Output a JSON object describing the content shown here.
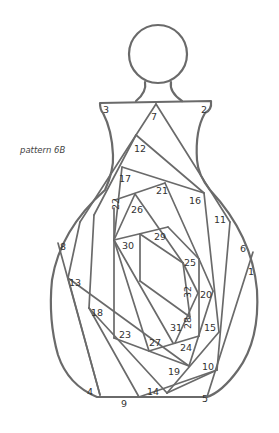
{
  "caption": "pattern 6B",
  "colors": {
    "line": "#6a6a6a",
    "text": "#333333",
    "background": "#ffffff"
  },
  "labels": [
    {
      "n": "1",
      "x": 248,
      "y": 275,
      "r": 0
    },
    {
      "n": "2",
      "x": 201,
      "y": 113,
      "r": 0
    },
    {
      "n": "3",
      "x": 103,
      "y": 113,
      "r": 0
    },
    {
      "n": "4",
      "x": 87,
      "y": 395,
      "r": 0
    },
    {
      "n": "5",
      "x": 202,
      "y": 402,
      "r": 0
    },
    {
      "n": "6",
      "x": 240,
      "y": 252,
      "r": 0
    },
    {
      "n": "7",
      "x": 151,
      "y": 120,
      "r": 0
    },
    {
      "n": "8",
      "x": 60,
      "y": 250,
      "r": 0
    },
    {
      "n": "9",
      "x": 121,
      "y": 407,
      "r": 0
    },
    {
      "n": "10",
      "x": 202,
      "y": 370,
      "r": 0
    },
    {
      "n": "11",
      "x": 214,
      "y": 223,
      "r": 0
    },
    {
      "n": "12",
      "x": 134,
      "y": 152,
      "r": 0
    },
    {
      "n": "13",
      "x": 69,
      "y": 286,
      "r": 0
    },
    {
      "n": "14",
      "x": 147,
      "y": 395,
      "r": 0
    },
    {
      "n": "15",
      "x": 204,
      "y": 331,
      "r": 0
    },
    {
      "n": "16",
      "x": 189,
      "y": 204,
      "r": 0
    },
    {
      "n": "17",
      "x": 119,
      "y": 182,
      "r": 0
    },
    {
      "n": "18",
      "x": 91,
      "y": 316,
      "r": 0
    },
    {
      "n": "19",
      "x": 168,
      "y": 375,
      "r": 0
    },
    {
      "n": "20",
      "x": 200,
      "y": 298,
      "r": 0
    },
    {
      "n": "21",
      "x": 156,
      "y": 194,
      "r": 0
    },
    {
      "n": "22",
      "x": 119,
      "y": 210,
      "r": -90
    },
    {
      "n": "23",
      "x": 119,
      "y": 338,
      "r": 0
    },
    {
      "n": "24",
      "x": 180,
      "y": 351,
      "r": 0
    },
    {
      "n": "25",
      "x": 184,
      "y": 266,
      "r": 0
    },
    {
      "n": "26",
      "x": 131,
      "y": 213,
      "r": 0
    },
    {
      "n": "27",
      "x": 149,
      "y": 346,
      "r": 0
    },
    {
      "n": "28",
      "x": 191,
      "y": 329,
      "r": -90
    },
    {
      "n": "29",
      "x": 154,
      "y": 240,
      "r": 0
    },
    {
      "n": "30",
      "x": 122,
      "y": 249,
      "r": 0
    },
    {
      "n": "31",
      "x": 170,
      "y": 331,
      "r": 0
    },
    {
      "n": "32",
      "x": 191,
      "y": 298,
      "r": -90
    }
  ]
}
